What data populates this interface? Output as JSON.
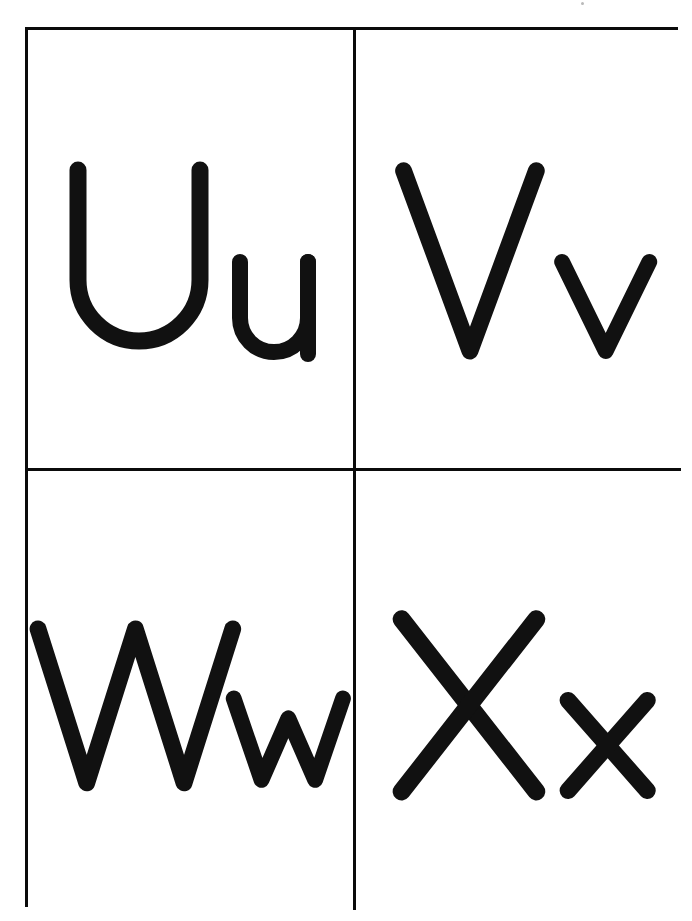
{
  "page": {
    "background_color": "#ffffff",
    "ink_color": "#111111",
    "border_color": "#0b0b0b",
    "width": 692,
    "height": 921,
    "artifact": "scanner-speck"
  },
  "grid": {
    "rows": 2,
    "columns": 2,
    "border_width_px": 3
  },
  "cards": [
    {
      "id": "card-uu",
      "position": "top-left",
      "uppercase": "U",
      "lowercase": "u",
      "pair_label": "Uu",
      "letter_name": "U"
    },
    {
      "id": "card-vv",
      "position": "top-right",
      "uppercase": "V",
      "lowercase": "v",
      "pair_label": "Vv",
      "letter_name": "V"
    },
    {
      "id": "card-ww",
      "position": "bottom-left",
      "uppercase": "W",
      "lowercase": "w",
      "pair_label": "Ww",
      "letter_name": "W"
    },
    {
      "id": "card-xx",
      "position": "bottom-right",
      "uppercase": "X",
      "lowercase": "x",
      "pair_label": "Xx",
      "letter_name": "X"
    }
  ]
}
